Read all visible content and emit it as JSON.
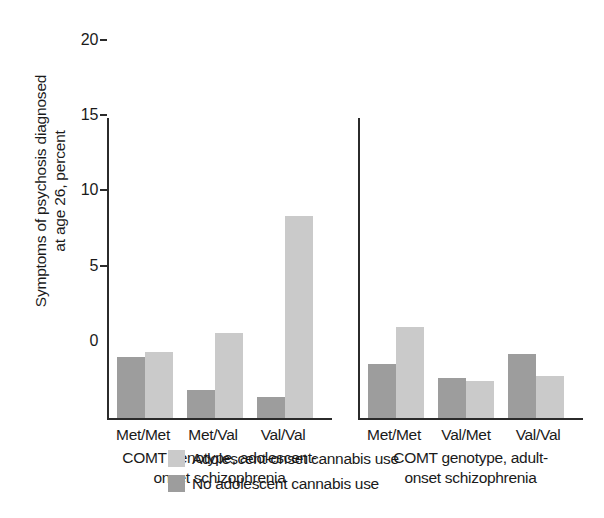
{
  "chart_data": {
    "type": "bar",
    "title": "",
    "xlabel": "COMT genotype",
    "ylabel_line1": "Symptoms of psychosis diagnosed",
    "ylabel_line2": "at age 26, percent",
    "ylim": [
      0,
      20
    ],
    "yticks": [
      0,
      5,
      10,
      15,
      20
    ],
    "ytick_labels": [
      "0",
      "5",
      "10",
      "15",
      "20"
    ],
    "grid": false,
    "legend_position": "bottom-center",
    "legend": [
      {
        "name": "Adolescent-onset cannabis use",
        "color": "#cacaca"
      },
      {
        "name": "No adolescent cannabis use",
        "color": "#9d9d9d"
      }
    ],
    "panels": [
      {
        "id": "adolescent-onset",
        "caption_line1": "COMT genotype, adolescent-",
        "caption_line2": "onset schizophrenia",
        "categories": [
          "Met/Met",
          "Met/Val",
          "Val/Val"
        ],
        "series": [
          {
            "name": "No adolescent cannabis use",
            "color": "#9d9d9d",
            "values": [
              4.1,
              1.9,
              1.4
            ]
          },
          {
            "name": "Adolescent-onset cannabis use",
            "color": "#cacaca",
            "values": [
              4.4,
              5.7,
              13.5
            ]
          }
        ]
      },
      {
        "id": "adult-onset",
        "caption_line1": "COMT genotype, adult-",
        "caption_line2": "onset schizophrenia",
        "categories": [
          "Met/Met",
          "Val/Met",
          "Val/Val"
        ],
        "series": [
          {
            "name": "No adolescent cannabis use",
            "color": "#9d9d9d",
            "values": [
              3.6,
              2.7,
              4.3
            ]
          },
          {
            "name": "Adolescent-onset cannabis use",
            "color": "#cacaca",
            "values": [
              6.1,
              2.5,
              2.8
            ]
          }
        ]
      }
    ]
  }
}
